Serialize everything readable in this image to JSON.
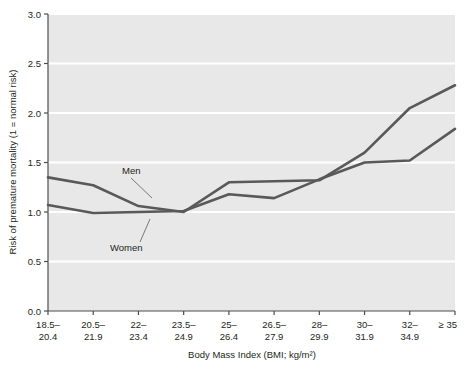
{
  "figure": {
    "name": "bmi-mortality-risk-chart",
    "background": "#ffffff",
    "plot_background": "#e8e8e8",
    "gridline_color": "#ffffff",
    "line_color": "#595959",
    "axis_color": "#4d4d4d"
  },
  "labels": {
    "men": "Men",
    "women": "Women",
    "caption_partial": ""
  },
  "chart_data": {
    "type": "line",
    "title": "",
    "xlabel": "Body Mass Index (BMI; kg/m²)",
    "ylabel": "Risk of premature mortality (1 = normal risk)",
    "grid": true,
    "legend_position": "inline-annotation",
    "ylim": [
      0.0,
      3.0
    ],
    "yticks": [
      0.0,
      0.5,
      1.0,
      1.5,
      2.0,
      2.5,
      3.0
    ],
    "ytick_labels": [
      "0.0",
      "0.5",
      "1.0",
      "1.5",
      "2.0",
      "2.5",
      "3.0"
    ],
    "categories": [
      "18.5–20.4",
      "20.5–21.9",
      "22–23.4",
      "23.5–24.9",
      "25–26.4",
      "26.5–27.9",
      "28–29.9",
      "30–31.9",
      "32–34.9",
      "≥ 35"
    ],
    "xtick_labels_line1": [
      "18.5–",
      "20.5–",
      "22–",
      "23.5–",
      "25–",
      "26.5–",
      "28–",
      "30–",
      "32–",
      "≥ 35"
    ],
    "xtick_labels_line2": [
      "20.4",
      "21.9",
      "23.4",
      "24.9",
      "26.4",
      "27.9",
      "29.9",
      "31.9",
      "34.9",
      ""
    ],
    "series": [
      {
        "name": "Men",
        "color": "#595959",
        "values": [
          1.35,
          1.27,
          1.06,
          1.0,
          1.3,
          1.31,
          1.32,
          1.6,
          2.05,
          2.28
        ]
      },
      {
        "name": "Women",
        "color": "#595959",
        "values": [
          1.07,
          0.99,
          1.0,
          1.01,
          1.18,
          1.14,
          1.33,
          1.5,
          1.52,
          1.84
        ]
      }
    ]
  }
}
